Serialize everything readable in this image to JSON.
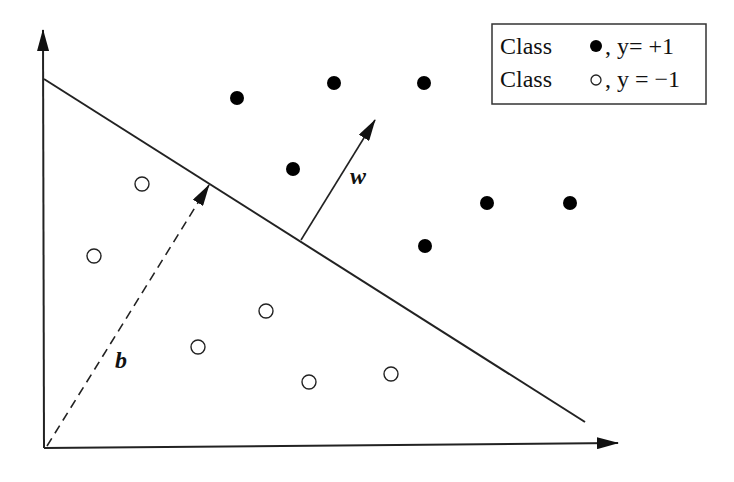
{
  "diagram": {
    "colors": {
      "ink": "#222222",
      "background": "#ffffff",
      "filled_point": "#000000",
      "hollow_point_fill": "#ffffff"
    },
    "axes": {
      "origin": [
        45,
        447
      ],
      "y_axis_top": [
        43,
        30
      ],
      "x_axis_end": [
        618,
        443
      ]
    },
    "hyperplane": {
      "from": [
        44,
        79
      ],
      "to": [
        585,
        422
      ]
    },
    "vectors": {
      "w": {
        "label": "w",
        "from": [
          301,
          240
        ],
        "to": [
          375,
          120
        ],
        "style": "solid"
      },
      "b": {
        "label": "b",
        "from": [
          47,
          446
        ],
        "to": [
          209,
          185
        ],
        "style": "dashed"
      }
    },
    "labels": {
      "w": "w",
      "b": "b"
    },
    "legend": {
      "entries": [
        {
          "label": "Class",
          "marker": "filled-circle",
          "suffix": ", y= +1"
        },
        {
          "label": "Class",
          "marker": "hollow-circle",
          "suffix": ", y = −1"
        }
      ]
    },
    "points": {
      "positive": [
        [
          237,
          98
        ],
        [
          334,
          83
        ],
        [
          424,
          83
        ],
        [
          293,
          169
        ],
        [
          487,
          203
        ],
        [
          570,
          203
        ],
        [
          425,
          246
        ]
      ],
      "negative": [
        [
          142,
          184
        ],
        [
          94,
          256
        ],
        [
          266,
          311
        ],
        [
          198,
          347
        ],
        [
          309,
          382
        ],
        [
          391,
          374
        ]
      ]
    }
  }
}
